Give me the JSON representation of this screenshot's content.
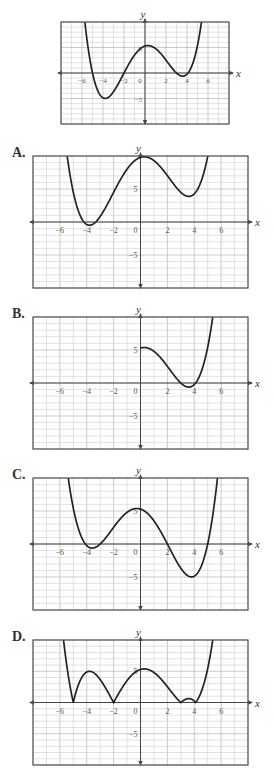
{
  "question": {
    "reference_graph_description": "Graph of a quartic-like function f(x)",
    "options": [
      {
        "letter": "A.",
        "description": "Graph shifted up"
      },
      {
        "letter": "B.",
        "description": "Graph only for x >= 0"
      },
      {
        "letter": "C.",
        "description": "Graph reflected over y-axis"
      },
      {
        "letter": "D.",
        "description": "Absolute value of graph"
      }
    ]
  },
  "chart_data": [
    {
      "id": "reference",
      "type": "line",
      "title": "",
      "xlabel": "x",
      "ylabel": "y",
      "xlim": [
        -8,
        8
      ],
      "ylim": [
        -10,
        10
      ],
      "x_ticks": [
        "-6",
        "-4",
        "-2",
        "0",
        "2",
        "4",
        "6"
      ],
      "y_ticks": [
        "5",
        "-5"
      ],
      "grid": true,
      "key_points": [
        [
          -5.6,
          10
        ],
        [
          -5,
          0
        ],
        [
          -4,
          -4.5
        ],
        [
          -2,
          0
        ],
        [
          0.3,
          5
        ],
        [
          3.5,
          -0.6
        ],
        [
          4,
          0
        ],
        [
          5.3,
          10
        ]
      ],
      "transform": "f(x)"
    },
    {
      "id": "A",
      "type": "line",
      "title": "A.",
      "xlabel": "x",
      "ylabel": "y",
      "xlim": [
        -8,
        8
      ],
      "ylim": [
        -10,
        10
      ],
      "x_ticks": [
        "-6",
        "-4",
        "-2",
        "0",
        "2",
        "4",
        "6"
      ],
      "y_ticks": [
        "5",
        "-5"
      ],
      "grid": true,
      "key_points": [
        [
          -5.6,
          10
        ],
        [
          -4,
          0
        ],
        [
          -2,
          4.5
        ],
        [
          0.3,
          9.5
        ],
        [
          3.5,
          3.9
        ],
        [
          4.9,
          10
        ]
      ],
      "transform": "f(x) + 4.5"
    },
    {
      "id": "B",
      "type": "line",
      "title": "B.",
      "xlabel": "x",
      "ylabel": "y",
      "xlim": [
        -8,
        8
      ],
      "ylim": [
        -10,
        10
      ],
      "x_ticks": [
        "-6",
        "-4",
        "-2",
        "0",
        "2",
        "4",
        "6"
      ],
      "y_ticks": [
        "5",
        "-5"
      ],
      "grid": true,
      "key_points": [
        [
          0,
          5
        ],
        [
          3.5,
          -0.6
        ],
        [
          4,
          0
        ],
        [
          5.3,
          10
        ]
      ],
      "transform": "f(|x|) for x >= 0"
    },
    {
      "id": "C",
      "type": "line",
      "title": "C.",
      "xlabel": "x",
      "ylabel": "y",
      "xlim": [
        -8,
        8
      ],
      "ylim": [
        -10,
        10
      ],
      "x_ticks": [
        "-6",
        "-4",
        "-2",
        "0",
        "2",
        "4",
        "6"
      ],
      "y_ticks": [
        "5",
        "-5"
      ],
      "grid": true,
      "key_points": [
        [
          -5.3,
          10
        ],
        [
          -4,
          0
        ],
        [
          -3.5,
          -0.6
        ],
        [
          -0.3,
          5
        ],
        [
          2,
          0
        ],
        [
          4,
          -4.5
        ],
        [
          5,
          0
        ],
        [
          5.6,
          10
        ]
      ],
      "transform": "f(-x)"
    },
    {
      "id": "D",
      "type": "line",
      "title": "D.",
      "xlabel": "x",
      "ylabel": "y",
      "xlim": [
        -8,
        8
      ],
      "ylim": [
        -10,
        10
      ],
      "x_ticks": [
        "-6",
        "-4",
        "-2",
        "0",
        "2",
        "4",
        "6"
      ],
      "y_ticks": [
        "5",
        "-5"
      ],
      "grid": true,
      "key_points": [
        [
          -5.6,
          10
        ],
        [
          -5,
          0
        ],
        [
          -4,
          4.5
        ],
        [
          -2,
          0
        ],
        [
          0.3,
          5
        ],
        [
          3,
          0
        ],
        [
          3.5,
          0.6
        ],
        [
          4,
          0
        ],
        [
          5.3,
          10
        ]
      ],
      "transform": "|f(x)|"
    }
  ],
  "layout": [
    {
      "id": "reference",
      "left": 61,
      "top": 22,
      "width": 168,
      "height": 102,
      "label": ""
    },
    {
      "id": "A",
      "left": 33,
      "top": 156,
      "width": 215,
      "height": 132,
      "label": "A."
    },
    {
      "id": "B",
      "left": 33,
      "top": 317,
      "width": 215,
      "height": 132,
      "label": "B."
    },
    {
      "id": "C",
      "left": 33,
      "top": 478,
      "width": 215,
      "height": 132,
      "label": "C."
    },
    {
      "id": "D",
      "left": 33,
      "top": 640,
      "width": 215,
      "height": 125,
      "label": "D."
    }
  ],
  "colors": {
    "frame": "#555555",
    "grid_minor": "#cfcfcf",
    "grid_major": "#a8a8a8",
    "axis": "#444444",
    "curve": "#222222",
    "tick_label": "#555555"
  }
}
